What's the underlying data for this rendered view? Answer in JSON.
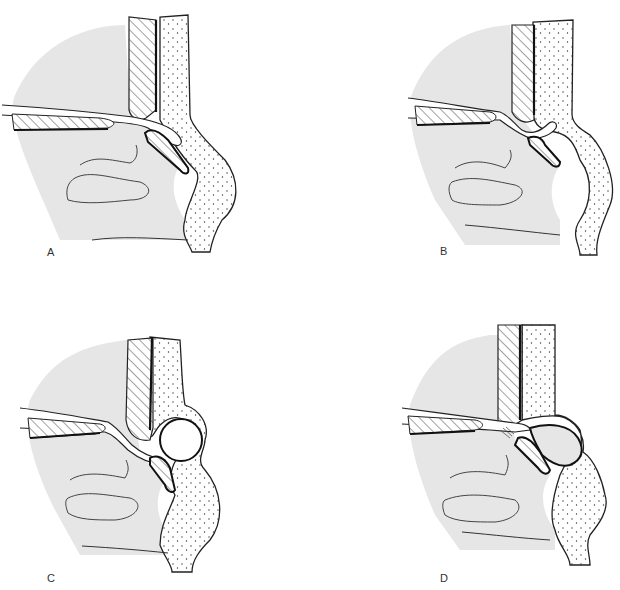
{
  "figure": {
    "panels": [
      {
        "id": "A",
        "label": "A",
        "variant": "normal"
      },
      {
        "id": "B",
        "label": "B",
        "variant": "small-protrusion"
      },
      {
        "id": "C",
        "label": "C",
        "variant": "round-cyst"
      },
      {
        "id": "D",
        "label": "D",
        "variant": "large-filled-cyst"
      }
    ]
  },
  "colors": {
    "background": "#ffffff",
    "tissue_fill": "#e6e6e6",
    "line": "#1a1a1a",
    "dots": "#333333"
  }
}
